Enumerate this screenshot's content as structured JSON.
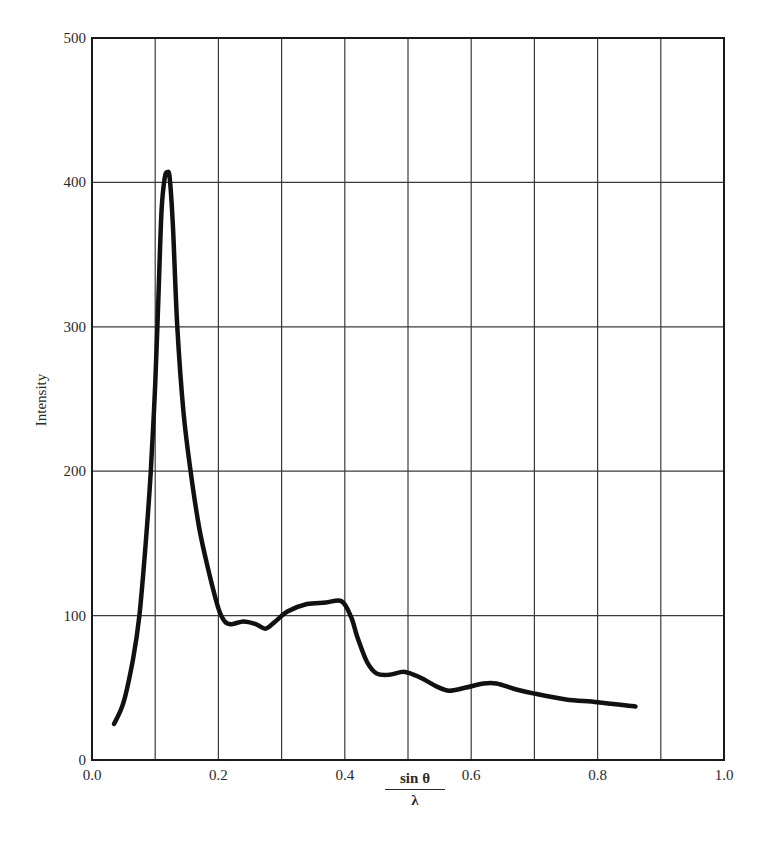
{
  "chart_data": {
    "type": "line",
    "title": "",
    "xlabel": "sin θ / λ",
    "xlabel_numerator": "sin θ",
    "xlabel_denominator": "λ",
    "ylabel": "Intensity",
    "xlim": [
      0.0,
      1.0
    ],
    "ylim": [
      0,
      500
    ],
    "grid": true,
    "legend": null,
    "x_ticks": [
      0.0,
      0.1,
      0.2,
      0.3,
      0.4,
      0.5,
      0.6,
      0.7,
      0.8,
      0.9,
      1.0
    ],
    "x_tick_labels": [
      "0.0",
      "",
      "0.2",
      "",
      "0.4",
      "",
      "0.6",
      "",
      "0.8",
      "",
      "1.0"
    ],
    "y_ticks": [
      0,
      100,
      200,
      300,
      400,
      500
    ],
    "y_tick_labels": [
      "0",
      "100",
      "200",
      "300",
      "400",
      "500"
    ],
    "series": [
      {
        "name": "Intensity",
        "color": "#111111",
        "x": [
          0.035,
          0.05,
          0.065,
          0.075,
          0.085,
          0.093,
          0.1,
          0.105,
          0.11,
          0.115,
          0.119,
          0.123,
          0.128,
          0.135,
          0.145,
          0.156,
          0.17,
          0.185,
          0.2,
          0.21,
          0.22,
          0.24,
          0.26,
          0.275,
          0.29,
          0.31,
          0.34,
          0.37,
          0.395,
          0.41,
          0.42,
          0.435,
          0.45,
          0.47,
          0.495,
          0.52,
          0.545,
          0.565,
          0.59,
          0.62,
          0.64,
          0.67,
          0.7,
          0.75,
          0.8,
          0.86
        ],
        "y": [
          25,
          40,
          70,
          100,
          150,
          200,
          260,
          320,
          380,
          403,
          407,
          403,
          370,
          300,
          240,
          200,
          160,
          130,
          105,
          96,
          94,
          96,
          94,
          91,
          96,
          103,
          108,
          109,
          110,
          99,
          85,
          68,
          60,
          59,
          61,
          57,
          51,
          48,
          50,
          53,
          53,
          49,
          46,
          42,
          40,
          37
        ]
      }
    ]
  },
  "colors": {
    "background": "#ffffff",
    "frame": "#1a1a1a",
    "grid": "#3a3a3a",
    "curve": "#111111",
    "text": "#2a2a2a"
  }
}
